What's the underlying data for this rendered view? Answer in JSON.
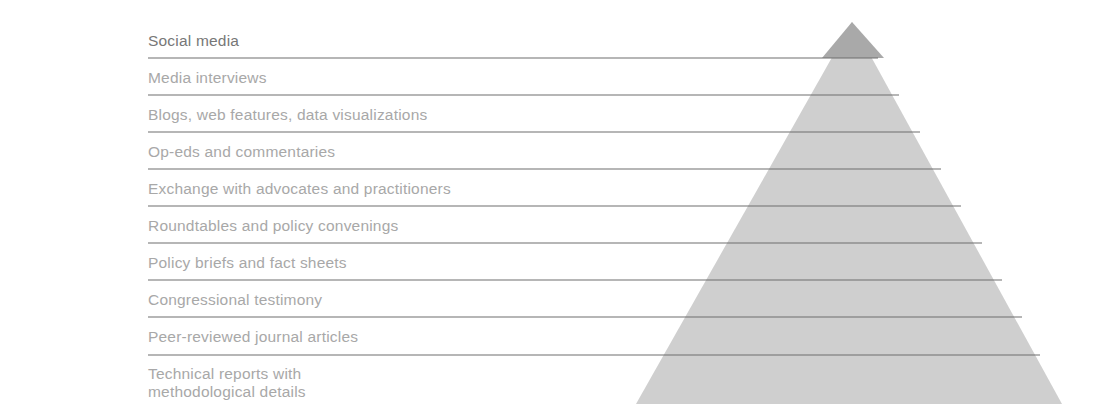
{
  "diagram": {
    "type": "pyramid",
    "layers_top_to_bottom": [
      {
        "label": "Social media",
        "line1": "Social media",
        "line2": ""
      },
      {
        "label": "Media interviews",
        "line1": "Media interviews",
        "line2": ""
      },
      {
        "label": "Blogs, web features, data visualizations",
        "line1": "Blogs, web features, data visualizations",
        "line2": ""
      },
      {
        "label": "Op-eds and commentaries",
        "line1": "Op-eds and commentaries",
        "line2": ""
      },
      {
        "label": "Exchange with advocates and practitioners",
        "line1": "Exchange with advocates and practitioners",
        "line2": ""
      },
      {
        "label": "Roundtables and policy convenings",
        "line1": "Roundtables and policy convenings",
        "line2": ""
      },
      {
        "label": "Policy briefs and fact sheets",
        "line1": "Policy briefs and fact sheets",
        "line2": ""
      },
      {
        "label": "Congressional testimony",
        "line1": "Congressional testimony",
        "line2": ""
      },
      {
        "label": "Peer-reviewed journal articles",
        "line1": "Peer-reviewed journal articles",
        "line2": ""
      },
      {
        "label": "Technical reports with methodological details",
        "line1": "Technical reports with",
        "line2": "methodological details"
      }
    ],
    "colors": {
      "pyramid_fill": "#cfcfcf",
      "apex_fill": "#a9a9a9",
      "divider": "#666666",
      "label_text": "#a8a8a8",
      "first_label_text": "#777777"
    }
  }
}
